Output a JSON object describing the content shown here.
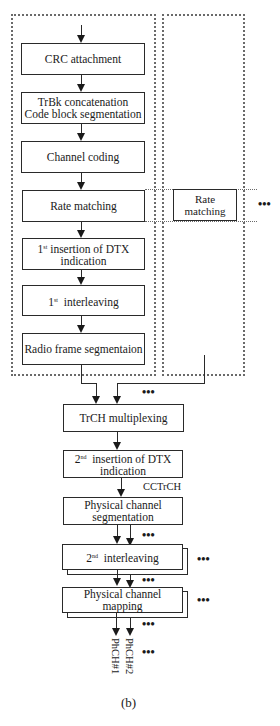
{
  "diagram": {
    "caption": "(b)",
    "transport_channel_chain": {
      "boxes": [
        {
          "id": "crc",
          "label": "CRC attachment"
        },
        {
          "id": "trbk",
          "label": "TrBk concatenation\nCode block segmentation"
        },
        {
          "id": "coding",
          "label": "Channel coding"
        },
        {
          "id": "rate",
          "label": "Rate matching"
        },
        {
          "id": "dtx1",
          "label": "1st insertion of DTX\nindication"
        },
        {
          "id": "int1",
          "label": "1st  interleaving"
        },
        {
          "id": "radio",
          "label": "Radio frame segmentaion"
        }
      ]
    },
    "parallel_chain": {
      "box_label": "Rate matching",
      "continuation": "•••"
    },
    "composite_chain": {
      "boxes": [
        {
          "id": "mux",
          "label": "TrCH multiplexing"
        },
        {
          "id": "dtx2",
          "label": "2nd  insertion of DTX\nindication"
        },
        {
          "id": "seg",
          "label": "Physical channel\nsegmentation"
        },
        {
          "id": "int2",
          "label": "2nd  interleaving"
        },
        {
          "id": "map",
          "label": "Physical channel mapping"
        }
      ],
      "cctrch_label": "CCTrCH"
    },
    "outputs": [
      "PhCH#1",
      "PhCH#2"
    ],
    "ellipsis": "•••"
  }
}
